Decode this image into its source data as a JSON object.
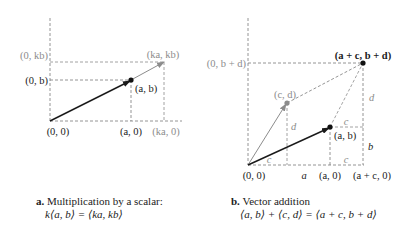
{
  "panel_a": {
    "labels": {
      "origin": "(0, 0)",
      "y_b": "(0, b)",
      "y_kb": "(0, kb)",
      "point_ab": "(a, b)",
      "point_kakb": "(ka, kb)",
      "x_a": "(a, 0)",
      "x_ka": "(ka, 0)"
    },
    "caption": {
      "letter": "a.",
      "title": "Multiplication by a scalar:",
      "formula": "k⟨a, b⟩ = ⟨ka, kb⟩"
    }
  },
  "panel_b": {
    "labels": {
      "origin": "(0, 0)",
      "y_bd": "(0, b + d)",
      "point_cd": "(c, d)",
      "point_ab": "(a, b)",
      "point_sum": "(a + c, b + d)",
      "x_a": "(a, 0)",
      "x_ac": "(a + c, 0)",
      "seg_a": "a",
      "seg_c_bottom_left": "c",
      "seg_c_bottom_right": "c",
      "seg_c_top": "c",
      "seg_d_left": "d",
      "seg_d_right": "d",
      "seg_b": "b"
    },
    "caption": {
      "letter": "b.",
      "title": "Vector addition",
      "formula": "⟨a, b⟩ + ⟨c, d⟩ = ⟨a + c, b + d⟩"
    }
  },
  "colors": {
    "dark": "#1a1a1a",
    "gray": "#8c8c8c",
    "dash": "#7a7a7a"
  }
}
